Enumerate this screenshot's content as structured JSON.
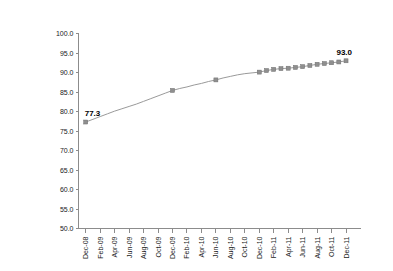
{
  "chart_data": {
    "type": "line",
    "title": "",
    "subtitle": "",
    "xlabel": "",
    "ylabel": "",
    "ylim": [
      50.0,
      100.0
    ],
    "ytick_step": 5.0,
    "ytick_labels": [
      "100.0",
      "95.0",
      "90.0",
      "85.0",
      "80.0",
      "75.0",
      "70.0",
      "65.0",
      "60.0",
      "55.0",
      "50.0"
    ],
    "ytick_values": [
      100.0,
      95.0,
      90.0,
      85.0,
      80.0,
      75.0,
      70.0,
      65.0,
      60.0,
      55.0,
      50.0
    ],
    "grid": false,
    "legend": "none",
    "x_axis_months": [
      "Dec-08",
      "Jan-09",
      "Feb-09",
      "Mar-09",
      "Apr-09",
      "May-09",
      "Jun-09",
      "Jul-09",
      "Aug-09",
      "Sep-09",
      "Oct-09",
      "Nov-09",
      "Dec-09",
      "Jan-10",
      "Feb-10",
      "Mar-10",
      "Apr-10",
      "May-10",
      "Jun-10",
      "Jul-10",
      "Aug-10",
      "Sep-10",
      "Oct-10",
      "Nov-10",
      "Dec-10",
      "Jan-11",
      "Feb-11",
      "Mar-11",
      "Apr-11",
      "May-11",
      "Jun-11",
      "Jul-11",
      "Aug-11",
      "Sep-11",
      "Oct-11",
      "Nov-11",
      "Dec-11"
    ],
    "xtick_labels": [
      "Dec-08",
      "Feb-09",
      "Apr-09",
      "Jun-09",
      "Aug-09",
      "Oct-09",
      "Dec-09",
      "Feb-10",
      "Apr-10",
      "Jun-10",
      "Aug-10",
      "Oct-10",
      "Dec-10",
      "Feb-11",
      "Apr-11",
      "Jun-11",
      "Aug-11",
      "Oct-11",
      "Dec-11"
    ],
    "series": [
      {
        "name": "Series 1",
        "x": [
          "Dec-08",
          "Jan-09",
          "Feb-09",
          "Mar-09",
          "Apr-09",
          "May-09",
          "Jun-09",
          "Jul-09",
          "Aug-09",
          "Sep-09",
          "Oct-09",
          "Nov-09",
          "Dec-09",
          "Jan-10",
          "Feb-10",
          "Mar-10",
          "Apr-10",
          "May-10",
          "Jun-10",
          "Jul-10",
          "Aug-10",
          "Sep-10",
          "Oct-10",
          "Nov-10",
          "Dec-10",
          "Jan-11",
          "Feb-11",
          "Mar-11",
          "Apr-11",
          "May-11",
          "Jun-11",
          "Jul-11",
          "Aug-11",
          "Sep-11",
          "Oct-11",
          "Nov-11",
          "Dec-11"
        ],
        "values": [
          77.3,
          78.0,
          78.7,
          79.4,
          80.1,
          80.7,
          81.3,
          81.9,
          82.6,
          83.3,
          84.0,
          84.7,
          85.4,
          85.9,
          86.3,
          86.8,
          87.2,
          87.7,
          88.1,
          88.6,
          89.0,
          89.4,
          89.7,
          89.9,
          90.1,
          90.5,
          90.8,
          91.0,
          91.1,
          91.3,
          91.5,
          91.8,
          92.1,
          92.3,
          92.5,
          92.7,
          93.0
        ],
        "marker_months": [
          "Dec-08",
          "Dec-09",
          "Jun-10",
          "Dec-10",
          "Jan-11",
          "Feb-11",
          "Mar-11",
          "Apr-11",
          "May-11",
          "Jun-11",
          "Jul-11",
          "Aug-11",
          "Sep-11",
          "Oct-11",
          "Nov-11",
          "Dec-11"
        ],
        "color": "#8f8f8f"
      }
    ],
    "annotations": [
      {
        "label": "77.3",
        "at": "Dec-08",
        "value": 77.3
      },
      {
        "label": "93.0",
        "at": "Dec-11",
        "value": 93.0
      }
    ]
  },
  "colors": {
    "line": "#9a9a9a",
    "marker": "#8f8f8f",
    "axis": "#8c8c8c",
    "text": "#1a1a1a",
    "annotation": "#000000",
    "background": "#ffffff"
  }
}
